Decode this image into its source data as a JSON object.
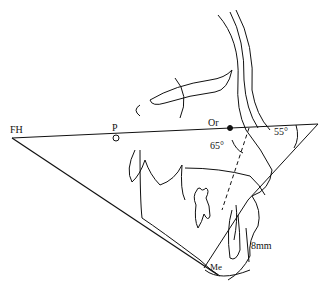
{
  "diagram": {
    "type": "cephalometric-tracing",
    "labels": {
      "fh": "FH",
      "p": "P",
      "or": "Or",
      "angle_65": "65°",
      "angle_55": "55°",
      "mm8": "8mm",
      "me": "Me"
    },
    "colors": {
      "line": "#111111",
      "background": "#ffffff"
    }
  }
}
